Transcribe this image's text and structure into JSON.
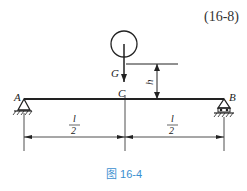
{
  "equation_number": "(16-8)",
  "caption": "图 16-4",
  "labels": {
    "weight": "G",
    "height": "h",
    "support_left": "A",
    "support_right": "B",
    "midpoint": "C",
    "span_left_num": "l",
    "span_left_den": "2",
    "span_right_num": "l",
    "span_right_den": "2"
  },
  "colors": {
    "line": "#222222",
    "caption": "#3a8fd0"
  }
}
